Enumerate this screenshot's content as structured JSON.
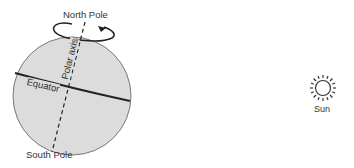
{
  "diagram": {
    "labels": {
      "north_pole": "North Pole",
      "south_pole": "South Pole",
      "equator": "Equator",
      "polar_axis": "Polar axis",
      "sun": "Sun"
    },
    "icons": {
      "earth": "sphere",
      "sun": "sun-icon",
      "rotation": "rotation-arrow-icon"
    },
    "colors": {
      "earth_fill": "#d9d9d9",
      "outline": "#6b6b6b",
      "lines": "#222222"
    }
  }
}
